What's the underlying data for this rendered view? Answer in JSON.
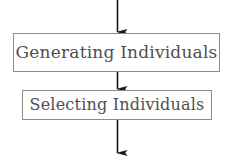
{
  "diagram": {
    "type": "flowchart",
    "orientation": "vertical",
    "background_color": "#ffffff",
    "border_color": "#8c8c8c",
    "text_color": "#4f4f4f",
    "arrow_color": "#1a1a1a",
    "nodes": [
      {
        "id": "generating",
        "label": "Generating Individuals",
        "shape": "rectangle"
      },
      {
        "id": "selecting",
        "label": "Selecting Individuals",
        "shape": "rectangle"
      }
    ],
    "edges": [
      {
        "id": "entry",
        "from": "",
        "to": "generating",
        "style": "solid-arrow"
      },
      {
        "id": "generating-to-selecting",
        "from": "generating",
        "to": "selecting",
        "style": "solid-arrow"
      },
      {
        "id": "exit",
        "from": "selecting",
        "to": "",
        "style": "solid-arrow"
      }
    ]
  }
}
